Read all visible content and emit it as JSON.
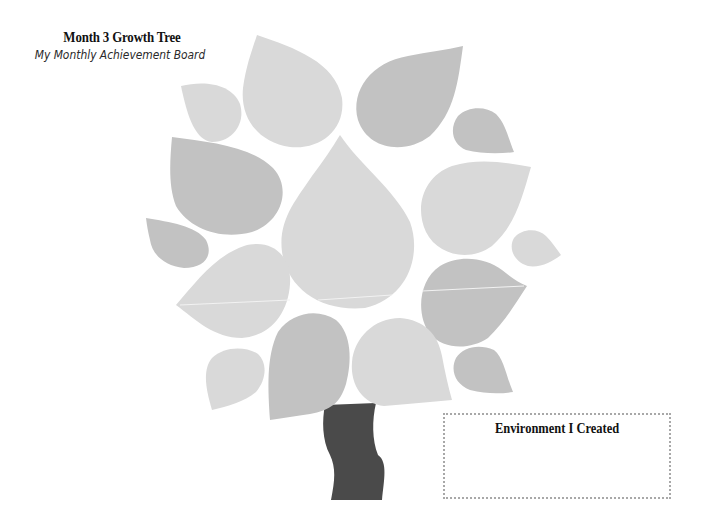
{
  "header": {
    "title": "Month 3 Growth Tree",
    "subtitle": "My Monthly Achievement Board"
  },
  "tree": {
    "leaf_count": 16,
    "colors": {
      "leaf_light": "#d9d9d9",
      "leaf_dark": "#c2c2c2",
      "trunk": "#4a4a4a",
      "vein": "#f2f2f2"
    }
  },
  "environment_box": {
    "title": "Environment I Created",
    "border_color": "#a8a8a8"
  }
}
